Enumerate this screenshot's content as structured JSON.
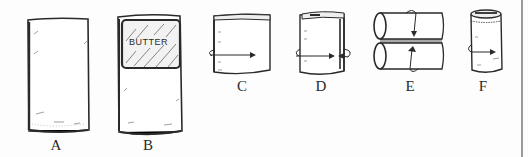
{
  "figures": [
    {
      "id": "A",
      "label": "A",
      "description": "plain sleeping pad / blanket laid flat"
    },
    {
      "id": "B",
      "label": "B",
      "description": "blanket with butter package placed at top",
      "item_text": "BUTTER"
    },
    {
      "id": "C",
      "label": "C",
      "description": "top folded down, roll in direction of arrow"
    },
    {
      "id": "D",
      "label": "D",
      "description": "side folded in, rolled with arrows"
    },
    {
      "id": "E",
      "label": "E",
      "description": "two rolls folded together with arrows"
    },
    {
      "id": "F",
      "label": "F",
      "description": "final compact roll with arrow"
    }
  ],
  "colors": {
    "ink": "#2a2a2a",
    "paper": "#fdfdfd",
    "edge": "#9a9a9a"
  }
}
